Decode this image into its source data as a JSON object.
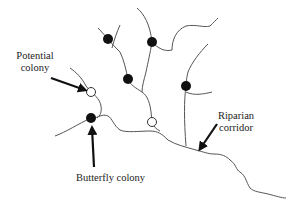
{
  "diagram": {
    "type": "stream network with colonies",
    "labels": {
      "potential_colony_line1": "Potential",
      "potential_colony_line2": "colony",
      "riparian_line1": "Riparian",
      "riparian_line2": "corridor",
      "butterfly_colony": "Butterfly colony"
    },
    "colors": {
      "stream": "#555555",
      "colony_fill": "#111111",
      "potential_fill": "#ffffff",
      "arrow": "#111111",
      "text": "#222222"
    },
    "colonies": {
      "occupied": [
        {
          "x": 108,
          "y": 39
        },
        {
          "x": 152,
          "y": 42
        },
        {
          "x": 128,
          "y": 79
        },
        {
          "x": 186,
          "y": 86
        },
        {
          "x": 91,
          "y": 118
        }
      ],
      "potential": [
        {
          "x": 91,
          "y": 92
        },
        {
          "x": 152,
          "y": 122
        }
      ]
    }
  }
}
